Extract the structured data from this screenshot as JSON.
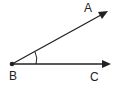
{
  "diagram": {
    "type": "angle",
    "vertex": {
      "label": "B",
      "x": 12,
      "y": 64
    },
    "rays": [
      {
        "name": "BA",
        "label": "A",
        "end": {
          "x": 106,
          "y": 12
        }
      },
      {
        "name": "BC",
        "label": "C",
        "end": {
          "x": 110,
          "y": 64
        }
      }
    ],
    "angle_marker": {
      "type": "arc",
      "single": true
    },
    "stroke_color": "#222222",
    "background": "#ffffff"
  },
  "labels": {
    "A": "A",
    "B": "B",
    "C": "C"
  }
}
